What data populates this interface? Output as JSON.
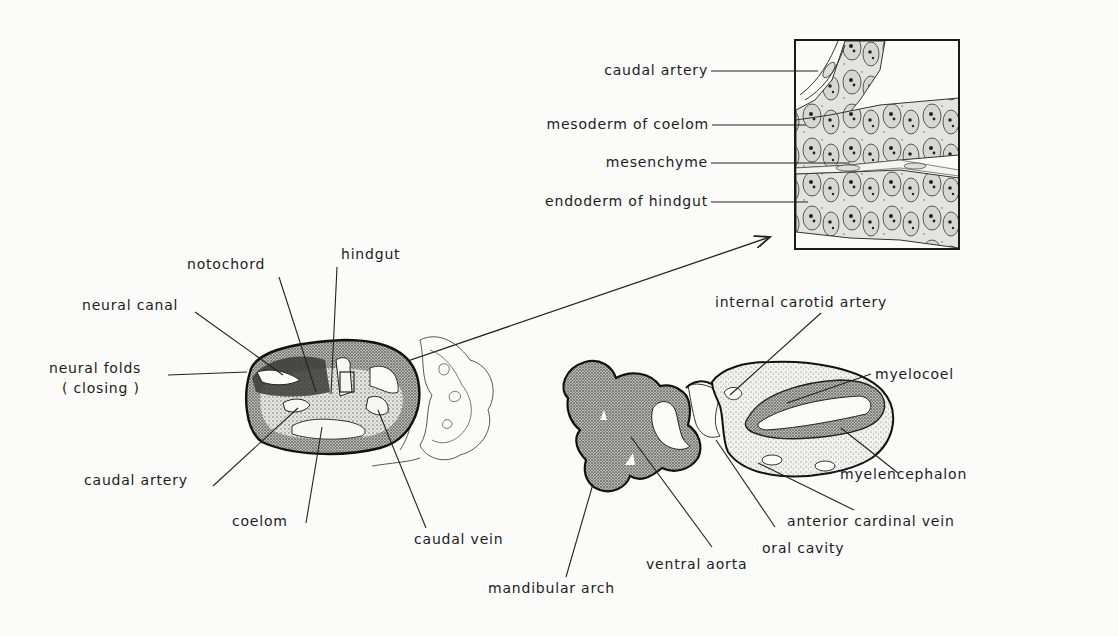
{
  "figure": {
    "inset": {
      "labels": {
        "caudal_artery": "caudal artery",
        "mesoderm_of_coelom": "mesoderm of coelom",
        "mesenchyme": "mesenchyme",
        "endoderm_of_hindgut": "endoderm of hindgut"
      }
    },
    "tail_section": {
      "labels": {
        "notochord": "notochord",
        "hindgut": "hindgut",
        "neural_canal": "neural canal",
        "neural_folds": "neural folds",
        "neural_folds_sub": "( closing )",
        "caudal_artery": "caudal artery",
        "coelom": "coelom",
        "caudal_vein": "caudal vein"
      }
    },
    "head_section": {
      "labels": {
        "internal_carotid_artery": "internal carotid artery",
        "myelocoel": "myelocoel",
        "myelencephalon": "myelencephalon",
        "anterior_cardinal_vein": "anterior cardinal vein",
        "oral_cavity": "oral cavity",
        "ventral_aorta": "ventral aorta",
        "mandibular_arch": "mandibular arch"
      }
    }
  }
}
